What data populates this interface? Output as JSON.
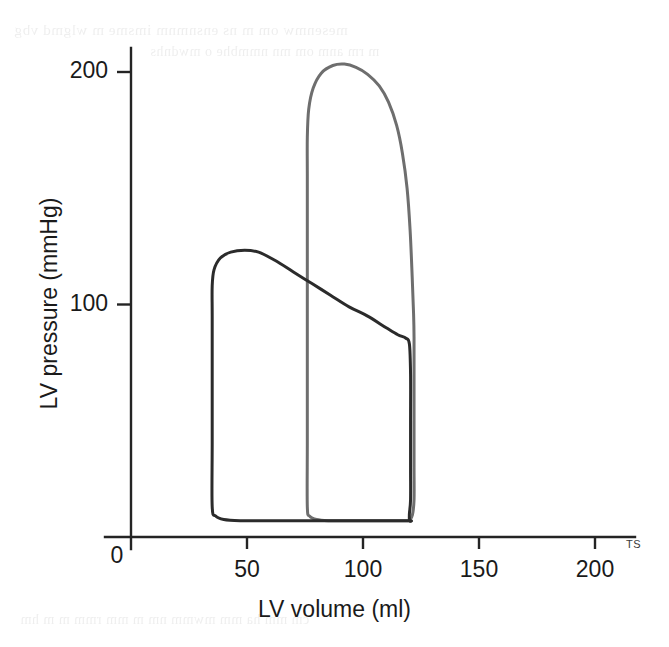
{
  "figure": {
    "kind": "pressure-volume-loop-diagram",
    "background_color": "#ffffff",
    "bleed_through": {
      "line_1": "mesenmw om m ns ensnmnm imsme m   wlgmd vbg",
      "line_2": "m rm anm om mn  nmmbhe o  mwdnhs",
      "line_3": "cm mm ha  mm  mwmm nm  m  mm rmm  m m hm"
    }
  },
  "axes": {
    "x": {
      "label": "LV volume (ml)",
      "unit": "ml",
      "min": 0,
      "max": 200,
      "ticks": [
        0,
        50,
        100,
        150,
        200
      ],
      "tick_labels": [
        "0",
        "50",
        "100",
        "150",
        "200"
      ],
      "pixel_min": 131,
      "pixel_max": 595
    },
    "y": {
      "label": "LV pressure (mmHg)",
      "unit": "mmHg",
      "min": 0,
      "max": 200,
      "ticks": [
        0,
        100,
        200
      ],
      "tick_labels": [
        "0",
        "100",
        "200"
      ],
      "pixel_min": 537,
      "pixel_max": 72
    },
    "origin_label": "0",
    "axis_color": "#242424",
    "axis_width": 2.4
  },
  "annotations": {
    "corner_mark": "TS"
  },
  "chart_data": {
    "type": "line",
    "title": "",
    "xlabel": "LV volume (ml)",
    "ylabel": "LV pressure (mmHg)",
    "xlim": [
      0,
      200
    ],
    "ylim": [
      0,
      200
    ],
    "grid": false,
    "legend": "none",
    "series": [
      {
        "name": "Control pressure-volume loop",
        "color": "#2b2b2b",
        "line_width": 3.0,
        "closed": true,
        "end_diastolic_volume_ml": 120,
        "end_systolic_volume_ml": 35,
        "stroke_volume_ml": 85,
        "peak_systolic_pressure_mmHg": 123,
        "end_diastolic_pressure_mmHg": 7,
        "end_systolic_pressure_mmHg": 84,
        "peak_pressure_volume_ml": 53,
        "points": [
          [
            120,
            7
          ],
          [
            108,
            7
          ],
          [
            95,
            7
          ],
          [
            82,
            7
          ],
          [
            70,
            7
          ],
          [
            58,
            7
          ],
          [
            47,
            7
          ],
          [
            40,
            7.5
          ],
          [
            36.5,
            9
          ],
          [
            35,
            13
          ],
          [
            35,
            40
          ],
          [
            35,
            70
          ],
          [
            35,
            95
          ],
          [
            35,
            108
          ],
          [
            35.8,
            115
          ],
          [
            38.5,
            120
          ],
          [
            43,
            122.5
          ],
          [
            49,
            123.3
          ],
          [
            55,
            122.5
          ],
          [
            62,
            119
          ],
          [
            70,
            114
          ],
          [
            78,
            109
          ],
          [
            86,
            104
          ],
          [
            94,
            99
          ],
          [
            102,
            95
          ],
          [
            110,
            90
          ],
          [
            115,
            87
          ],
          [
            118.5,
            85.5
          ],
          [
            120,
            83
          ],
          [
            120.5,
            70
          ],
          [
            120.5,
            50
          ],
          [
            120.5,
            30
          ],
          [
            120.5,
            16
          ],
          [
            120,
            10
          ],
          [
            120,
            7
          ]
        ]
      },
      {
        "name": "Increased afterload pressure-volume loop",
        "color": "#6e6e6e",
        "line_width": 3.0,
        "closed": true,
        "end_diastolic_volume_ml": 120,
        "end_systolic_volume_ml": 76,
        "stroke_volume_ml": 44,
        "peak_systolic_pressure_mmHg": 203,
        "end_diastolic_pressure_mmHg": 7,
        "end_systolic_pressure_mmHg": 88,
        "peak_pressure_volume_ml": 92,
        "points": [
          [
            120,
            7
          ],
          [
            110,
            7
          ],
          [
            100,
            7
          ],
          [
            92,
            7
          ],
          [
            85,
            7
          ],
          [
            80,
            7.5
          ],
          [
            77,
            9
          ],
          [
            76,
            13
          ],
          [
            76,
            40
          ],
          [
            76,
            70
          ],
          [
            76,
            100
          ],
          [
            76,
            130
          ],
          [
            76,
            155
          ],
          [
            76,
            172
          ],
          [
            76.6,
            184
          ],
          [
            78.5,
            193
          ],
          [
            82,
            199.5
          ],
          [
            87,
            202.8
          ],
          [
            92,
            203.4
          ],
          [
            97,
            202
          ],
          [
            102,
            199
          ],
          [
            107,
            194
          ],
          [
            111,
            187
          ],
          [
            114.5,
            177
          ],
          [
            117,
            165
          ],
          [
            119,
            150
          ],
          [
            120.3,
            132
          ],
          [
            121.2,
            112
          ],
          [
            121.8,
            96
          ],
          [
            122,
            86
          ],
          [
            122,
            70
          ],
          [
            122,
            50
          ],
          [
            122,
            30
          ],
          [
            122,
            16
          ],
          [
            121.3,
            9.5
          ],
          [
            120,
            7
          ]
        ]
      }
    ]
  }
}
